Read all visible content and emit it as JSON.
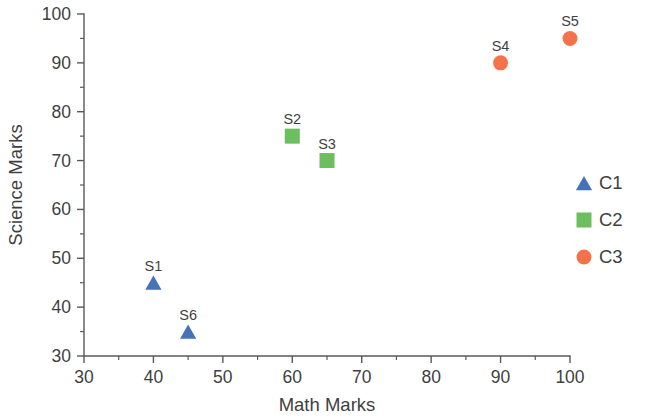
{
  "chart_data": {
    "type": "scatter",
    "title": "",
    "xlabel": "Math Marks",
    "ylabel": "Science Marks",
    "xlim": [
      30,
      100
    ],
    "ylim": [
      30,
      100
    ],
    "x_ticks": [
      30,
      40,
      50,
      60,
      70,
      80,
      90,
      100
    ],
    "y_ticks": [
      30,
      40,
      50,
      60,
      70,
      80,
      90,
      100
    ],
    "x_tick_labels": [
      "30",
      "40",
      "50",
      "60",
      "70",
      "80",
      "90",
      "100"
    ],
    "y_tick_labels": [
      "30",
      "40",
      "50",
      "60",
      "70",
      "80",
      "90",
      "100"
    ],
    "x_minor_step": 5,
    "y_minor_step": 5,
    "grid": false,
    "legend_position": "right",
    "series": [
      {
        "name": "C1",
        "marker": "triangle",
        "color": "#4573b5",
        "points": [
          {
            "label": "S1",
            "x": 40,
            "y": 45
          },
          {
            "label": "S6",
            "x": 45,
            "y": 35
          }
        ]
      },
      {
        "name": "C2",
        "marker": "square",
        "color": "#6cbe5e",
        "points": [
          {
            "label": "S2",
            "x": 60,
            "y": 75
          },
          {
            "label": "S3",
            "x": 65,
            "y": 70
          }
        ]
      },
      {
        "name": "C3",
        "marker": "circle",
        "color": "#f4734a",
        "points": [
          {
            "label": "S4",
            "x": 90,
            "y": 90
          },
          {
            "label": "S5",
            "x": 100,
            "y": 95
          }
        ]
      }
    ]
  },
  "legend": {
    "entries": [
      {
        "label": "C1",
        "marker": "triangle",
        "color": "#4573b5"
      },
      {
        "label": "C2",
        "marker": "square",
        "color": "#6cbe5e"
      },
      {
        "label": "C3",
        "marker": "circle",
        "color": "#f4734a"
      }
    ]
  },
  "layout": {
    "plot_left": 84,
    "plot_right": 570,
    "plot_top": 14,
    "plot_bottom": 356,
    "legend_x": 578,
    "legend_marker_x": 584,
    "legend_y_start": 183,
    "legend_row_gap": 37
  }
}
